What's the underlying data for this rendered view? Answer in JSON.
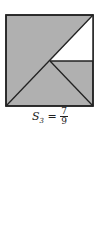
{
  "figure": {
    "fill_color": "#b0b0b0",
    "line_color": "#222222",
    "background": "#ffffff",
    "square": {
      "x1": 6,
      "y1": 15,
      "x2": 93,
      "y2": 106
    },
    "center": {
      "x": 50,
      "y": 61
    }
  },
  "caption": {
    "label": "S",
    "subscript": "3",
    "equals": "=",
    "numerator": "7",
    "denominator": "9"
  }
}
